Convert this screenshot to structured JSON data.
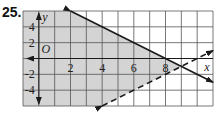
{
  "problem_number": "25.",
  "chart_data": {
    "type": "line",
    "title": "",
    "xlabel": "x",
    "ylabel": "y",
    "origin_label": "O",
    "xlim": [
      -1,
      11
    ],
    "ylim": [
      -6,
      6
    ],
    "grid": true,
    "x_grid_step": 1,
    "y_grid_step": 2,
    "x_tick_labels": [
      "2",
      "4",
      "6",
      "8"
    ],
    "x_ticks": [
      2,
      4,
      6,
      8
    ],
    "y_tick_labels": [
      "4",
      "2",
      "-2",
      "-4"
    ],
    "y_ticks": [
      4,
      2,
      -2,
      -4
    ],
    "series": [
      {
        "name": "boundary-solid",
        "style": "solid",
        "equation": "y = -x + 8",
        "points": [
          [
            2,
            6
          ],
          [
            11,
            -3
          ]
        ]
      },
      {
        "name": "boundary-dashed",
        "style": "dashed",
        "equation": "y = x - 10",
        "points": [
          [
            4,
            -6
          ],
          [
            11,
            1
          ]
        ]
      }
    ],
    "shaded_region": "y <= -x + 8 and y > x - 10",
    "shade_color": "#d4d4d4",
    "line_color": "#1a1a1a",
    "grid_color": "#555555"
  }
}
